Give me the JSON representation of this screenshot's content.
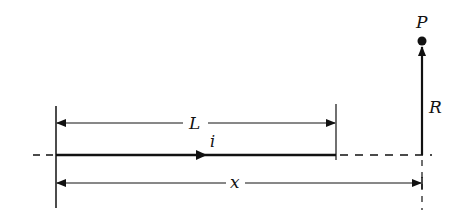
{
  "diagram": {
    "labels": {
      "point": "P",
      "length": "L",
      "current": "i",
      "distance_axial": "x",
      "distance_perpendicular": "R"
    },
    "colors": {
      "ink": "#111111",
      "background": "#ffffff"
    }
  }
}
